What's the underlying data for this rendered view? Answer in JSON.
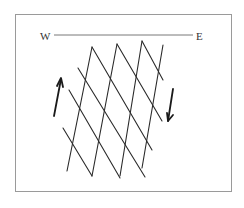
{
  "diagram": {
    "type": "fault-fracture-grid",
    "orientation_line": {
      "west_label": "W",
      "east_label": "E"
    },
    "arrows": [
      {
        "name": "left-arrow",
        "direction": "up"
      },
      {
        "name": "right-arrow",
        "direction": "down"
      }
    ],
    "colors": {
      "line": "#2a2a2a",
      "frame": "#9a9a9a",
      "background": "#ffffff",
      "text": "#333333"
    }
  }
}
